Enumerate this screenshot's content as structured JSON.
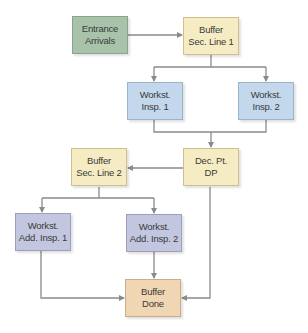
{
  "diagram": {
    "type": "flowchart",
    "colors": {
      "entrance": "#a9c3ab",
      "buffer": "#f5ecc4",
      "workstation": "#c3d8ec",
      "add_workstation": "#c2c6de",
      "done": "#f1d6b3",
      "connector": "#8a8a8a"
    },
    "nodes": {
      "entrance": {
        "line1": "Entrance",
        "line2": "Arrivals"
      },
      "buffer1": {
        "line1": "Buffer",
        "line2": "Sec. Line 1"
      },
      "insp1": {
        "line1": "Workst.",
        "line2": "Insp. 1"
      },
      "insp2": {
        "line1": "Workst.",
        "line2": "Insp. 2"
      },
      "buffer2": {
        "line1": "Buffer",
        "line2": "Sec. Line 2"
      },
      "decpt": {
        "line1": "Dec. Pt.",
        "line2": "DP"
      },
      "addinsp1": {
        "line1": "Workst.",
        "line2": "Add. Insp. 1"
      },
      "addinsp2": {
        "line1": "Workst.",
        "line2": "Add. Insp. 2"
      },
      "done": {
        "line1": "Buffer",
        "line2": "Done"
      }
    },
    "edges": [
      {
        "from": "Entrance Arrivals",
        "to": "Buffer Sec. Line 1"
      },
      {
        "from": "Buffer Sec. Line 1",
        "to": "Workst. Insp. 1"
      },
      {
        "from": "Buffer Sec. Line 1",
        "to": "Workst. Insp. 2"
      },
      {
        "from": "Workst. Insp. 1",
        "to": "Dec. Pt. DP"
      },
      {
        "from": "Workst. Insp. 2",
        "to": "Dec. Pt. DP"
      },
      {
        "from": "Dec. Pt. DP",
        "to": "Buffer Sec. Line 2"
      },
      {
        "from": "Dec. Pt. DP",
        "to": "Buffer Done"
      },
      {
        "from": "Buffer Sec. Line 2",
        "to": "Workst. Add. Insp. 1"
      },
      {
        "from": "Buffer Sec. Line 2",
        "to": "Workst. Add. Insp. 2"
      },
      {
        "from": "Workst. Add. Insp. 1",
        "to": "Buffer Done"
      },
      {
        "from": "Workst. Add. Insp. 2",
        "to": "Buffer Done"
      }
    ]
  }
}
